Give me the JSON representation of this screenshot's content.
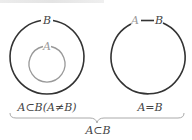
{
  "diagram": {
    "left": {
      "outer_label": "B",
      "inner_label": "A",
      "caption": "A⊂B(A≠B)"
    },
    "right": {
      "label_a": "A",
      "label_b": "B",
      "caption": "A=B"
    },
    "brace_caption": "A⊂B",
    "colors": {
      "outer_stroke": "#333333",
      "inner_stroke": "#999999",
      "gray_text": "#9a9a9a",
      "dark_text": "#444444"
    }
  }
}
